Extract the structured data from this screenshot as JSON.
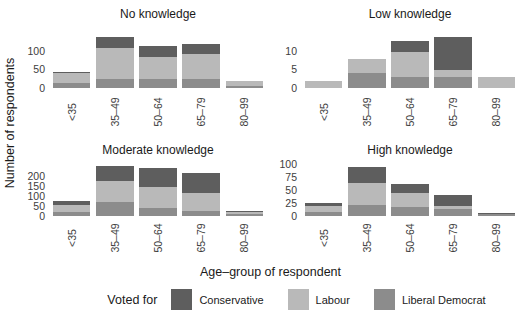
{
  "figure": {
    "y_axis_title": "Number of respondents",
    "x_axis_title": "Age–group of respondent",
    "legend": {
      "title": "Voted for",
      "entries": [
        {
          "label": "Conservative",
          "color_key": "conservative"
        },
        {
          "label": "Labour",
          "color_key": "labour"
        },
        {
          "label": "Liberal Democrat",
          "color_key": "liberal_democrat"
        }
      ]
    }
  },
  "chart_data": {
    "type": "bar",
    "stacked": true,
    "facet_layout": "2x2",
    "grid": "off",
    "legend_position": "bottom",
    "categories": [
      "<35",
      "35–49",
      "50–64",
      "65–79",
      "80–99"
    ],
    "xlabel": "Age–group of respondent",
    "ylabel": "Number of respondents",
    "colors": {
      "conservative": "#5e5e5e",
      "labour": "#b9b9b9",
      "liberal_democrat": "#8c8c8c"
    },
    "facets": [
      {
        "title": "No knowledge",
        "yticks": [
          0,
          50,
          100
        ],
        "ymax": 170,
        "series": [
          {
            "name": "Conservative",
            "color_key": "conservative",
            "values": [
              4,
              30,
              30,
              28,
              2
            ]
          },
          {
            "name": "Labour",
            "color_key": "labour",
            "values": [
              26,
              85,
              60,
              67,
              12
            ]
          },
          {
            "name": "Liberal Democrat",
            "color_key": "liberal_democrat",
            "values": [
              15,
              25,
              25,
              25,
              6
            ]
          }
        ]
      },
      {
        "title": "Low knowledge",
        "yticks": [
          0,
          5,
          10
        ],
        "ymax": 17,
        "series": [
          {
            "name": "Conservative",
            "color_key": "conservative",
            "values": [
              0,
              0,
              3,
              9,
              0
            ]
          },
          {
            "name": "Labour",
            "color_key": "labour",
            "values": [
              2,
              4,
              7,
              2,
              3
            ]
          },
          {
            "name": "Liberal Democrat",
            "color_key": "liberal_democrat",
            "values": [
              0,
              4,
              3,
              3,
              0
            ]
          }
        ]
      },
      {
        "title": "Moderate knowledge",
        "yticks": [
          0,
          50,
          100,
          150,
          200
        ],
        "ymax": 270,
        "series": [
          {
            "name": "Conservative",
            "color_key": "conservative",
            "values": [
              20,
              75,
              95,
              100,
              3
            ]
          },
          {
            "name": "Labour",
            "color_key": "labour",
            "values": [
              35,
              105,
              105,
              90,
              13
            ]
          },
          {
            "name": "Liberal Democrat",
            "color_key": "liberal_democrat",
            "values": [
              20,
              70,
              40,
              25,
              9
            ]
          }
        ]
      },
      {
        "title": "High knowledge",
        "yticks": [
          0,
          25,
          50,
          75,
          100
        ],
        "ymax": 104,
        "series": [
          {
            "name": "Conservative",
            "color_key": "conservative",
            "values": [
              6,
              32,
              16,
              21,
              1
            ]
          },
          {
            "name": "Labour",
            "color_key": "labour",
            "values": [
              11,
              42,
              27,
              6,
              0
            ]
          },
          {
            "name": "Liberal Democrat",
            "color_key": "liberal_democrat",
            "values": [
              8,
              21,
              18,
              13,
              4
            ]
          }
        ]
      }
    ]
  }
}
